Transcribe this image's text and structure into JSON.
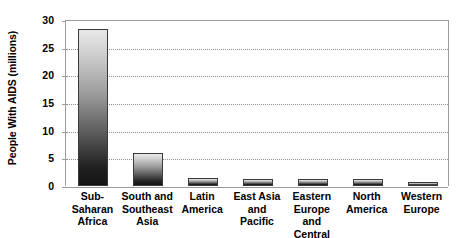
{
  "chart_data": {
    "type": "bar",
    "title": "",
    "subtitle": "",
    "xlabel": "",
    "ylabel": "People With AIDS (millions)",
    "categories": [
      "Sub-Saharan Africa",
      "South and Southeast Asia",
      "Latin America",
      "East Asia and Pacific",
      "Eastern Europe and Central Asia",
      "North America",
      "Western Europe"
    ],
    "category_lines": [
      [
        "Sub-Saharan",
        "Africa"
      ],
      [
        "South and",
        "Southeast",
        "Asia"
      ],
      [
        "Latin",
        "America"
      ],
      [
        "East Asia",
        "and",
        "Pacific"
      ],
      [
        "Eastern",
        "Europe and",
        "Central Asia"
      ],
      [
        "North",
        "America"
      ],
      [
        "Western",
        "Europe"
      ]
    ],
    "values": [
      28.4,
      6.0,
      1.5,
      1.3,
      1.3,
      1.3,
      0.7
    ],
    "ylim": [
      0,
      30
    ],
    "ytick_values": [
      0,
      5,
      10,
      15,
      20,
      25,
      30
    ],
    "ytick_labels": [
      "0",
      "5",
      "10",
      "15",
      "20",
      "25",
      "30"
    ],
    "grid": true,
    "grid_axis": "y",
    "grid_style": "dotted",
    "legend": false,
    "legend_position": "none",
    "bar_fill": "gradient-light-to-dark-gray",
    "bar_gradient_top_color": "#e8e8e8",
    "bar_gradient_bottom_color": "#141414",
    "bar_border_color": "#3a3a3a",
    "axis_line_color": "#9a9a9a",
    "gridline_color": "#909090",
    "background_color": "#ffffff",
    "text_color": "#000000"
  }
}
